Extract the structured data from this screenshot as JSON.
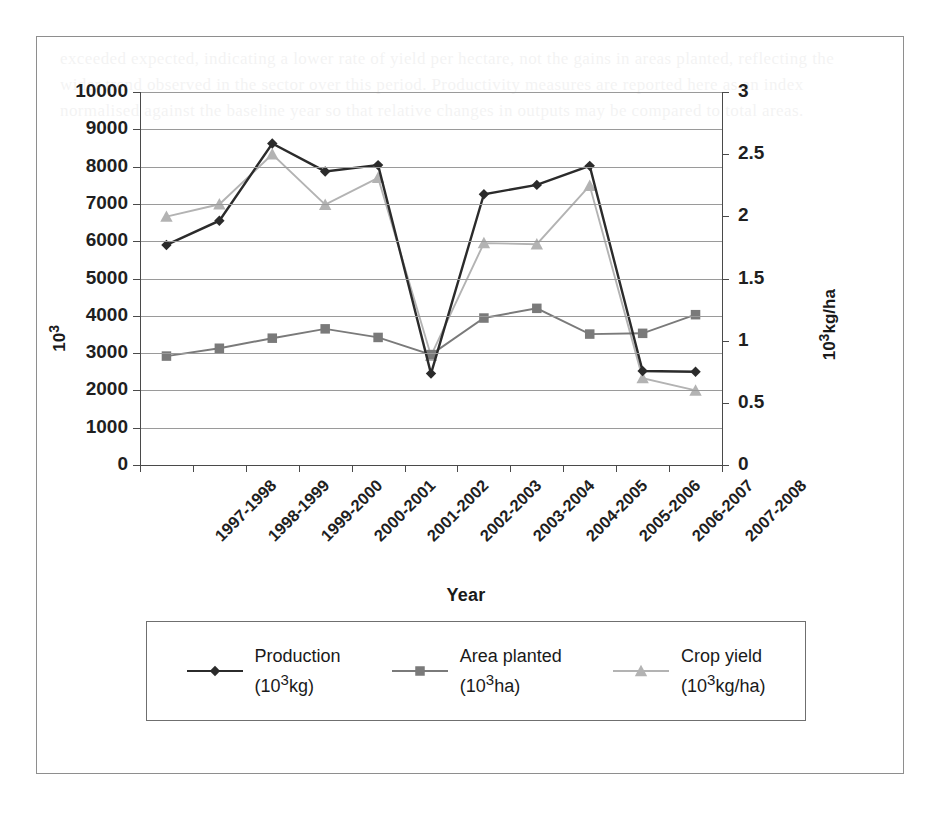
{
  "chart_data": {
    "type": "line",
    "title": "",
    "xlabel": "Year",
    "ylabel_left": "10³",
    "ylabel_right": "10³kg/ha",
    "grid": true,
    "legend_position": "bottom",
    "categories": [
      "1997-1998",
      "1998-1999",
      "1999-2000",
      "2000-2001",
      "2001-2002",
      "2002-2003",
      "2003-2004",
      "2004-2005",
      "2005-2006",
      "2006-2007",
      "2007-2008"
    ],
    "ylim_left": [
      0,
      10000
    ],
    "yticks_left": [
      0,
      1000,
      2000,
      3000,
      4000,
      5000,
      6000,
      7000,
      8000,
      9000,
      10000
    ],
    "ylim_right": [
      0,
      3
    ],
    "yticks_right": [
      0,
      0.5,
      1,
      1.5,
      2,
      2.5,
      3
    ],
    "series": [
      {
        "name": "Production",
        "units": "(10³kg)",
        "axis": "left",
        "marker": "diamond",
        "color": "#2b2b2b",
        "values": [
          5900,
          6550,
          8620,
          7870,
          8040,
          2450,
          7260,
          7510,
          8020,
          2520,
          2500
        ]
      },
      {
        "name": "Area planted",
        "units": "(10³ha)",
        "axis": "left",
        "marker": "square",
        "color": "#7a7a7a",
        "values": [
          2920,
          3130,
          3400,
          3650,
          3420,
          2960,
          3940,
          4200,
          3510,
          3530,
          4030
        ]
      },
      {
        "name": "Crop yield",
        "units": "(10³kg/ha)",
        "axis": "right",
        "marker": "triangle",
        "color": "#b3b3b3",
        "values_right_axis": [
          2.0,
          2.1,
          2.5,
          2.1,
          2.31,
          0.88,
          1.79,
          1.78,
          2.25,
          0.7,
          0.6
        ],
        "values": [
          6660,
          6990,
          8330,
          6980,
          7700,
          2930,
          5950,
          5920,
          7490,
          2330,
          2000
        ]
      }
    ],
    "legend": [
      {
        "label": "Production",
        "sub": "(10³kg)",
        "marker": "diamond",
        "color": "#2b2b2b"
      },
      {
        "label": "Area planted",
        "sub": "(10³ha)",
        "marker": "square",
        "color": "#7a7a7a"
      },
      {
        "label": "Crop yield",
        "sub": "(10³kg/ha)",
        "marker": "triangle",
        "color": "#b3b3b3"
      }
    ]
  },
  "bleed_text": "exceeded expected, indicating a lower rate of yield per hectare, not the gains in areas planted, reflecting the wider trend observed in the sector over this period. Productivity measures are reported here as an index normalised against the baseline year so that relative changes in outputs may be compared to total areas."
}
